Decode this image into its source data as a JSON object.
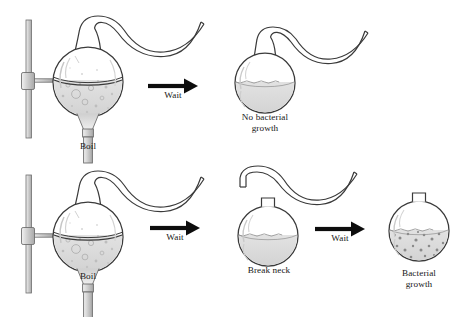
{
  "figure": {
    "width": 466,
    "height": 317,
    "background_color": "#ffffff"
  },
  "colors": {
    "outline": "#3a3a3a",
    "glass_line": "#4a4a4a",
    "broth_fill": "#d4d4d4",
    "broth_fill_light": "#dedede",
    "stand_fill": "#d8d8d8",
    "stand_outline": "#6e6e6e",
    "arrow": "#0d0d0d",
    "text": "#171717",
    "bacteria_dot": "#8c8c8c",
    "bubble": "#b0b0b0"
  },
  "rows": [
    {
      "id": "row-sterile",
      "name": "Sterile swan-neck flask remains free of growth",
      "steps": [
        {
          "id": "boil-swan-neck-flask",
          "label": "Boil",
          "label_lines": "Boil",
          "flask_type": "swan-neck-on-stand",
          "has_stand": true,
          "has_burner": true,
          "liquid_state": "boiling",
          "bacteria_present": false
        },
        {
          "id": "wait-arrow-1",
          "label": "Wait",
          "type": "arrow"
        },
        {
          "id": "no-bacterial-growth-flask",
          "label": "No bacterial\ngrowth",
          "label_lines": "No bacterial\ngrowth",
          "flask_type": "swan-neck",
          "has_stand": false,
          "has_burner": false,
          "liquid_state": "still",
          "bacteria_present": false
        }
      ]
    },
    {
      "id": "row-broken",
      "name": "Broken-neck flask becomes contaminated",
      "steps": [
        {
          "id": "boil-swan-neck-flask-2",
          "label": "Boil",
          "label_lines": "Boil",
          "flask_type": "swan-neck-on-stand",
          "has_stand": true,
          "has_burner": true,
          "liquid_state": "boiling",
          "bacteria_present": false
        },
        {
          "id": "wait-arrow-2",
          "label": "Wait",
          "type": "arrow"
        },
        {
          "id": "break-neck-flask",
          "label": "Break neck",
          "label_lines": "Break neck",
          "flask_type": "broken-neck",
          "has_stand": false,
          "has_burner": false,
          "liquid_state": "still",
          "bacteria_present": false
        },
        {
          "id": "wait-arrow-3",
          "label": "Wait",
          "type": "arrow"
        },
        {
          "id": "bacterial-growth-flask",
          "label": "Bacterial\ngrowth",
          "label_lines": "Bacterial\ngrowth",
          "flask_type": "short-neck",
          "has_stand": false,
          "has_burner": false,
          "liquid_state": "still",
          "bacteria_present": true
        }
      ]
    }
  ],
  "labels": {
    "boil_1": "Boil",
    "wait_1": "Wait",
    "no_growth": "No bacterial\ngrowth",
    "boil_2": "Boil",
    "wait_2": "Wait",
    "break_neck": "Break neck",
    "wait_3": "Wait",
    "growth": "Bacterial\ngrowth"
  }
}
